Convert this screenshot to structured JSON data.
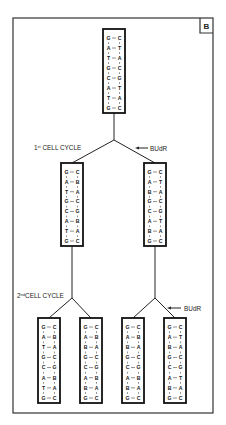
{
  "panel_label": "B",
  "labels": {
    "cycle1": "1st CELL CYCLE",
    "cycle1_num": "1",
    "cycle1_sup": "st",
    "cycle1_text": " CELL CYCLE",
    "cycle2_num": "2",
    "cycle2_sup": "nd",
    "cycle2_text": "CELL CYCLE",
    "budr_1": "BUdR",
    "budr_2": "BUdR"
  },
  "molecules": {
    "parent": {
      "left": [
        "G",
        "A",
        "T",
        "G",
        "C",
        "A",
        "T",
        "G"
      ],
      "right": [
        "C",
        "T",
        "A",
        "C",
        "G",
        "T",
        "A",
        "C"
      ]
    },
    "gen1_left": {
      "left": [
        "G",
        "A",
        "T",
        "G",
        "C",
        "A",
        "T",
        "G"
      ],
      "right": [
        "C",
        "B",
        "A",
        "C",
        "G",
        "B",
        "A",
        "C"
      ]
    },
    "gen1_right": {
      "left": [
        "G",
        "A",
        "B",
        "G",
        "C",
        "A",
        "B",
        "G"
      ],
      "right": [
        "C",
        "T",
        "A",
        "C",
        "G",
        "T",
        "A",
        "C"
      ]
    },
    "gen2_1": {
      "left": [
        "G",
        "A",
        "T",
        "G",
        "C",
        "A",
        "T",
        "G"
      ],
      "right": [
        "C",
        "B",
        "A",
        "C",
        "G",
        "B",
        "A",
        "C"
      ]
    },
    "gen2_2": {
      "left": [
        "G",
        "A",
        "B",
        "G",
        "C",
        "A",
        "B",
        "G"
      ],
      "right": [
        "C",
        "B",
        "A",
        "C",
        "G",
        "B",
        "A",
        "C"
      ]
    },
    "gen2_3": {
      "left": [
        "G",
        "A",
        "B",
        "G",
        "C",
        "A",
        "B",
        "G"
      ],
      "right": [
        "C",
        "B",
        "A",
        "C",
        "G",
        "B",
        "A",
        "C"
      ]
    },
    "gen2_4": {
      "left": [
        "G",
        "A",
        "B",
        "G",
        "C",
        "A",
        "B",
        "G"
      ],
      "right": [
        "C",
        "T",
        "A",
        "C",
        "G",
        "T",
        "A",
        "C"
      ]
    }
  }
}
